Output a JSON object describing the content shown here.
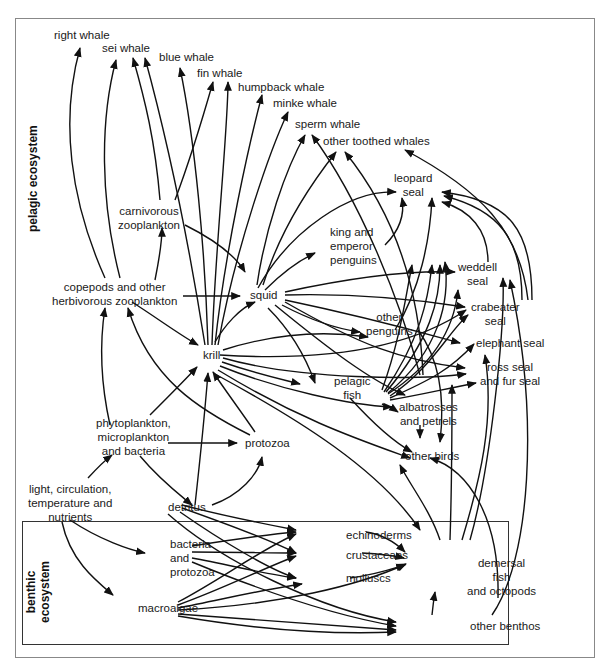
{
  "diagram": {
    "type": "food-web",
    "zones": {
      "pelagic": "pelagic ecosystem",
      "benthic_line1": "benthic",
      "benthic_line2": "ecosystem"
    },
    "nodes": {
      "right_whale": "right whale",
      "sei_whale": "sei whale",
      "blue_whale": "blue whale",
      "fin_whale": "fin whale",
      "humpback_whale": "humpback whale",
      "minke_whale": "minke whale",
      "sperm_whale": "sperm whale",
      "other_toothed_whales": "other toothed whales",
      "leopard_seal_1": "leopard",
      "leopard_seal_2": "seal",
      "carnivorous_zooplankton_1": "carnivorous",
      "carnivorous_zooplankton_2": "zooplankton",
      "king_emperor_penguins_1": "king and",
      "king_emperor_penguins_2": "emperor",
      "king_emperor_penguins_3": "penguins",
      "weddell_seal_1": "weddell",
      "weddell_seal_2": "seal",
      "copepods_1": "copepods and other",
      "copepods_2": "herbivorous zooplankton",
      "squid": "squid",
      "crabeater_seal_1": "crabeater",
      "crabeater_seal_2": "seal",
      "other_penguins_1": "other",
      "other_penguins_2": "penguins",
      "elephant_seal": "elephant seal",
      "krill": "krill",
      "ross_fur_seal_1": "ross seal",
      "ross_fur_seal_2": "and fur seal",
      "pelagic_fish_1": "pelagic",
      "pelagic_fish_2": "fish",
      "albatrosses_1": "albatrosses",
      "albatrosses_2": "and petrels",
      "phytoplankton_1": "phytoplankton,",
      "phytoplankton_2": "microplankton",
      "phytoplankton_3": "and bacteria",
      "protozoa": "protozoa",
      "other_birds": "other birds",
      "light_1": "light, circulation,",
      "light_2": "temperature and",
      "light_3": "nutrients",
      "detritus": "detritus",
      "echinoderms": "echinoderms",
      "bacteria_protozoa_1": "bacteria",
      "bacteria_protozoa_2": "and",
      "bacteria_protozoa_3": "protozoa",
      "crustaceans": "crustaceans",
      "demersal_1": "demersal",
      "demersal_2": "fish",
      "demersal_3": "and octopods",
      "molluscs": "molluscs",
      "macroalgae": "macroalgae",
      "other_benthos": "other benthos"
    },
    "links": [
      {
        "from": "copepods and other herbivorous zooplankton",
        "to": "right whale"
      },
      {
        "from": "copepods and other herbivorous zooplankton",
        "to": "sei whale"
      },
      {
        "from": "copepods and other herbivorous zooplankton",
        "to": "carnivorous zooplankton"
      },
      {
        "from": "copepods and other herbivorous zooplankton",
        "to": "squid"
      },
      {
        "from": "copepods and other herbivorous zooplankton",
        "to": "krill"
      },
      {
        "from": "carnivorous zooplankton",
        "to": "fin whale"
      },
      {
        "from": "carnivorous zooplankton",
        "to": "squid"
      },
      {
        "from": "krill",
        "to": "sei whale"
      },
      {
        "from": "krill",
        "to": "blue whale"
      },
      {
        "from": "krill",
        "to": "fin whale"
      },
      {
        "from": "krill",
        "to": "humpback whale"
      },
      {
        "from": "krill",
        "to": "minke whale"
      },
      {
        "from": "krill",
        "to": "squid"
      },
      {
        "from": "krill",
        "to": "other penguins"
      },
      {
        "from": "krill",
        "to": "pelagic fish"
      },
      {
        "from": "krill",
        "to": "albatrosses and petrels"
      },
      {
        "from": "krill",
        "to": "crabeater seal"
      },
      {
        "from": "krill",
        "to": "ross seal and fur seal"
      },
      {
        "from": "krill",
        "to": "other birds"
      },
      {
        "from": "krill",
        "to": "demersal fish and octopods"
      },
      {
        "from": "squid",
        "to": "sperm whale"
      },
      {
        "from": "squid",
        "to": "other toothed whales"
      },
      {
        "from": "squid",
        "to": "king and emperor penguins"
      },
      {
        "from": "squid",
        "to": "leopard seal"
      },
      {
        "from": "squid",
        "to": "weddell seal"
      },
      {
        "from": "squid",
        "to": "crabeater seal"
      },
      {
        "from": "squid",
        "to": "other penguins"
      },
      {
        "from": "squid",
        "to": "elephant seal"
      },
      {
        "from": "squid",
        "to": "ross seal and fur seal"
      },
      {
        "from": "squid",
        "to": "albatrosses and petrels"
      },
      {
        "from": "pelagic fish",
        "to": "leopard seal"
      },
      {
        "from": "pelagic fish",
        "to": "weddell seal"
      },
      {
        "from": "pelagic fish",
        "to": "crabeater seal"
      },
      {
        "from": "pelagic fish",
        "to": "elephant seal"
      },
      {
        "from": "pelagic fish",
        "to": "ross seal and fur seal"
      },
      {
        "from": "pelagic fish",
        "to": "albatrosses and petrels"
      },
      {
        "from": "pelagic fish",
        "to": "other birds"
      },
      {
        "from": "pelagic fish",
        "to": "sperm whale"
      },
      {
        "from": "pelagic fish",
        "to": "other toothed whales"
      },
      {
        "from": "king and emperor penguins",
        "to": "leopard seal"
      },
      {
        "from": "other penguins",
        "to": "leopard seal"
      },
      {
        "from": "other penguins",
        "to": "other birds"
      },
      {
        "from": "weddell seal",
        "to": "leopard seal"
      },
      {
        "from": "crabeater seal",
        "to": "leopard seal"
      },
      {
        "from": "crabeater seal",
        "to": "other toothed whales"
      },
      {
        "from": "albatrosses and petrels",
        "to": "other birds"
      },
      {
        "from": "phytoplankton, microplankton and bacteria",
        "to": "copepods and other herbivorous zooplankton"
      },
      {
        "from": "phytoplankton, microplankton and bacteria",
        "to": "krill"
      },
      {
        "from": "phytoplankton, microplankton and bacteria",
        "to": "protozoa"
      },
      {
        "from": "phytoplankton, microplankton and bacteria",
        "to": "detritus"
      },
      {
        "from": "protozoa",
        "to": "krill"
      },
      {
        "from": "protozoa",
        "to": "copepods and other herbivorous zooplankton"
      },
      {
        "from": "light, circulation, temperature and nutrients",
        "to": "phytoplankton, microplankton and bacteria"
      },
      {
        "from": "light, circulation, temperature and nutrients",
        "to": "bacteria and protozoa"
      },
      {
        "from": "light, circulation, temperature and nutrients",
        "to": "macroalgae"
      },
      {
        "from": "detritus",
        "to": "krill"
      },
      {
        "from": "detritus",
        "to": "protozoa"
      },
      {
        "from": "detritus",
        "to": "echinoderms"
      },
      {
        "from": "detritus",
        "to": "crustaceans"
      },
      {
        "from": "detritus",
        "to": "molluscs"
      },
      {
        "from": "detritus",
        "to": "other benthos"
      },
      {
        "from": "bacteria and protozoa",
        "to": "echinoderms"
      },
      {
        "from": "bacteria and protozoa",
        "to": "crustaceans"
      },
      {
        "from": "bacteria and protozoa",
        "to": "molluscs"
      },
      {
        "from": "bacteria and protozoa",
        "to": "other benthos"
      },
      {
        "from": "macroalgae",
        "to": "echinoderms"
      },
      {
        "from": "macroalgae",
        "to": "crustaceans"
      },
      {
        "from": "macroalgae",
        "to": "molluscs"
      },
      {
        "from": "macroalgae",
        "to": "demersal fish and octopods"
      },
      {
        "from": "macroalgae",
        "to": "other benthos"
      },
      {
        "from": "echinoderms",
        "to": "demersal fish and octopods"
      },
      {
        "from": "crustaceans",
        "to": "demersal fish and octopods"
      },
      {
        "from": "molluscs",
        "to": "demersal fish and octopods"
      },
      {
        "from": "other benthos",
        "to": "demersal fish and octopods"
      },
      {
        "from": "other benthos",
        "to": "weddell seal"
      },
      {
        "from": "demersal fish and octopods",
        "to": "other birds"
      },
      {
        "from": "demersal fish and octopods",
        "to": "ross seal and fur seal"
      },
      {
        "from": "demersal fish and octopods",
        "to": "elephant seal"
      },
      {
        "from": "demersal fish and octopods",
        "to": "leopard seal"
      },
      {
        "from": "demersal fish and octopods",
        "to": "weddell seal"
      },
      {
        "from": "demersal fish and octopods",
        "to": "other birds"
      }
    ],
    "colors": {
      "ink": "#111111",
      "frame": "#888888",
      "background": "#ffffff"
    }
  }
}
